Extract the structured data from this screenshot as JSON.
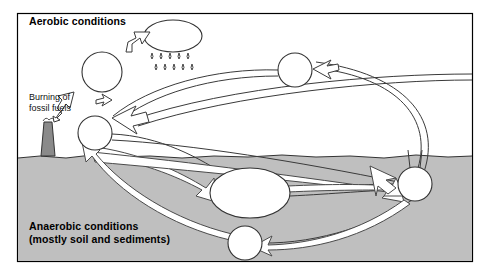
{
  "figure": {
    "type": "cycle-diagram",
    "frame": {
      "x": 17,
      "y": 13,
      "width": 456,
      "height": 249,
      "border_color": "#000000",
      "background": "#ffffff"
    },
    "ground": {
      "label": "anaerobic-zone-fill",
      "top_y": 156,
      "fill_color": "#bfbfbf",
      "edge_color": "#000000",
      "description": "wavy soil surface line separating aerobic air from anaerobic soil"
    }
  },
  "labels": {
    "aerobic": "Aerobic conditions",
    "anaerobic_line1": "Anaerobic conditions",
    "anaerobic_line2": "(mostly soil and sediments)",
    "burning_line1": "Burning of",
    "burning_line2": "fossil fuels"
  },
  "colors": {
    "page_background": "#ffffff",
    "soil_fill": "#bfbfbf",
    "node_fill": "#ffffff",
    "stroke": "#000000",
    "arrow_fill": "#ffffff",
    "arrow_stroke": "#555555",
    "smokestack_fill": "#8a8a8a",
    "text": "#000000"
  },
  "nodes": [
    {
      "id": "cloud",
      "name": "rain-cloud",
      "shape": "ellipse",
      "cx": 173,
      "cy": 36,
      "rx": 29,
      "ry": 16,
      "zone": "aerobic"
    },
    {
      "id": "pool-upper-left",
      "name": "pool-circle-upper-left",
      "shape": "circle",
      "cx": 102,
      "cy": 72,
      "r": 20,
      "zone": "aerobic"
    },
    {
      "id": "pool-top-right",
      "name": "pool-circle-top-right",
      "shape": "circle",
      "cx": 295,
      "cy": 70,
      "r": 17,
      "zone": "aerobic"
    },
    {
      "id": "pool-surface-left",
      "name": "pool-circle-surface-left",
      "shape": "circle",
      "cx": 95,
      "cy": 133,
      "r": 17,
      "zone": "surface"
    },
    {
      "id": "pool-center",
      "name": "pool-ellipse-center",
      "shape": "ellipse",
      "cx": 250,
      "cy": 193,
      "rx": 40,
      "ry": 25,
      "zone": "anaerobic"
    },
    {
      "id": "pool-right",
      "name": "pool-circle-right",
      "shape": "circle",
      "cx": 415,
      "cy": 184,
      "r": 17,
      "zone": "anaerobic"
    },
    {
      "id": "pool-bottom",
      "name": "pool-circle-bottom",
      "shape": "circle",
      "cx": 245,
      "cy": 243,
      "r": 17,
      "zone": "anaerobic"
    }
  ],
  "features": [
    {
      "id": "raindrops",
      "name": "raindrop-group",
      "count": 12,
      "rows": 2,
      "under": "cloud"
    },
    {
      "id": "smokestack",
      "name": "smokestack-icon",
      "x": 44,
      "y": 120,
      "height": 36,
      "emits": "smoke-puffs"
    }
  ],
  "arrows": [
    {
      "id": "a1",
      "name": "arrow-to-cloud",
      "from": "pool-upper-left",
      "to": "cloud",
      "style": "outline-block"
    },
    {
      "id": "a2",
      "name": "arrow-burning-emission",
      "from": "smokestack",
      "to": "pool-upper-left",
      "style": "outline-block"
    },
    {
      "id": "a3",
      "name": "arrow-into-surface-pool",
      "from": "cloud-region",
      "to": "pool-surface-left",
      "style": "outline-block"
    },
    {
      "id": "a4",
      "name": "arrow-surface-to-center",
      "from": "pool-surface-left",
      "to": "pool-center",
      "style": "ribbon"
    },
    {
      "id": "a5",
      "name": "arrow-surface-to-right",
      "from": "pool-surface-left",
      "to": "pool-right",
      "style": "ribbon"
    },
    {
      "id": "a6",
      "name": "arrow-center-to-right",
      "from": "pool-center",
      "to": "pool-right",
      "style": "ribbon"
    },
    {
      "id": "a7",
      "name": "arrow-right-to-bottom",
      "from": "pool-right",
      "to": "pool-bottom",
      "style": "ribbon"
    },
    {
      "id": "a8",
      "name": "arrow-bottom-to-surface",
      "from": "pool-bottom",
      "to": "pool-surface-left",
      "style": "ribbon"
    },
    {
      "id": "a9",
      "name": "arrow-right-to-top-right",
      "from": "pool-right",
      "to": "pool-top-right",
      "style": "outline-curve"
    },
    {
      "id": "a10",
      "name": "arrow-top-right-to-surface",
      "from": "pool-top-right",
      "to": "pool-surface-left",
      "style": "outline-curve"
    }
  ]
}
